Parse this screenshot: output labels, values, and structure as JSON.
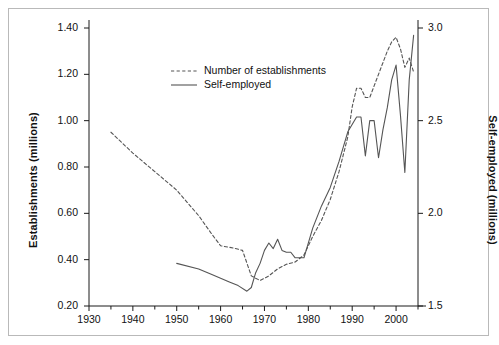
{
  "chart_data": {
    "type": "line",
    "title": "",
    "subtitle": "",
    "xlabel": "",
    "ylabel": "Establishments (millions)",
    "ylabel_right": "Self-employed (millions)",
    "grid": false,
    "legend_position": "top-center",
    "xlim": [
      1930,
      2005
    ],
    "xticks": [
      1930,
      1940,
      1950,
      1960,
      1970,
      1980,
      1990,
      2000
    ],
    "xtick_labels": [
      "1930",
      "1940",
      "1950",
      "1960",
      "1970",
      "1980",
      "1990",
      "2000"
    ],
    "x_minor_ticks": [
      1935,
      1945,
      1955,
      1965,
      1975,
      1985,
      1995,
      2005
    ],
    "ylim": [
      0.2,
      1.4
    ],
    "yticks": [
      0.2,
      0.4,
      0.6,
      0.8,
      1.0,
      1.2,
      1.4
    ],
    "ytick_labels": [
      "0.20",
      "0.40",
      "0.60",
      "0.80",
      "1.00",
      "1.20",
      "1.40"
    ],
    "ylim_right": [
      1.5,
      3.0
    ],
    "yticks_right": [
      1.5,
      2.0,
      2.5,
      3.0
    ],
    "ytick_labels_right": [
      "1.5",
      "2.0",
      "2.5",
      "3.0"
    ],
    "series": [
      {
        "name": "Number of establishments",
        "axis": "left",
        "style": "dashed",
        "color": "#555555",
        "x": [
          1935,
          1940,
          1945,
          1950,
          1955,
          1958,
          1960,
          1963,
          1965,
          1967,
          1969,
          1971,
          1973,
          1975,
          1977,
          1979,
          1981,
          1983,
          1985,
          1987,
          1989,
          1990,
          1991,
          1992,
          1993,
          1994,
          1995,
          1996,
          1997,
          1998,
          1999,
          2000,
          2001,
          2002,
          2003,
          2004
        ],
        "y": [
          0.95,
          0.86,
          0.78,
          0.7,
          0.59,
          0.51,
          0.46,
          0.45,
          0.44,
          0.33,
          0.31,
          0.33,
          0.36,
          0.38,
          0.39,
          0.42,
          0.5,
          0.57,
          0.66,
          0.78,
          0.93,
          1.06,
          1.14,
          1.14,
          1.1,
          1.1,
          1.15,
          1.2,
          1.25,
          1.3,
          1.34,
          1.36,
          1.31,
          1.23,
          1.27,
          1.21
        ]
      },
      {
        "name": "Self-employed",
        "axis": "right",
        "style": "solid",
        "color": "#555555",
        "x": [
          1950,
          1955,
          1958,
          1960,
          1962,
          1964,
          1966,
          1967,
          1968,
          1969,
          1970,
          1971,
          1972,
          1973,
          1974,
          1975,
          1976,
          1977,
          1978,
          1979,
          1981,
          1983,
          1985,
          1987,
          1989,
          1991,
          1992,
          1993,
          1994,
          1995,
          1996,
          1997,
          1998,
          1999,
          2000,
          2001,
          2002,
          2003,
          2004
        ],
        "y": [
          1.73,
          1.7,
          1.67,
          1.65,
          1.63,
          1.61,
          1.58,
          1.6,
          1.68,
          1.73,
          1.8,
          1.84,
          1.81,
          1.86,
          1.8,
          1.79,
          1.79,
          1.76,
          1.76,
          1.76,
          1.92,
          2.04,
          2.14,
          2.28,
          2.44,
          2.52,
          2.52,
          2.31,
          2.5,
          2.5,
          2.3,
          2.45,
          2.57,
          2.72,
          2.8,
          2.53,
          2.22,
          2.72,
          2.96
        ]
      }
    ]
  },
  "legend": {
    "items": [
      {
        "label": "Number of establishments",
        "style": "dashed"
      },
      {
        "label": "Self-employed",
        "style": "solid"
      }
    ]
  }
}
